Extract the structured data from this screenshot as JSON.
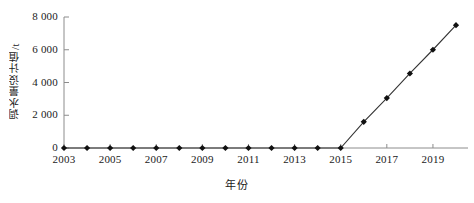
{
  "chart_data": {
    "type": "line",
    "title": "",
    "xlabel": "年份",
    "ylabel": "调水量设计值/t",
    "x": [
      2003,
      2004,
      2005,
      2006,
      2007,
      2008,
      2009,
      2010,
      2011,
      2012,
      2013,
      2014,
      2015,
      2016,
      2017,
      2018,
      2019,
      2020
    ],
    "values": [
      0,
      0,
      0,
      0,
      0,
      0,
      0,
      0,
      0,
      0,
      0,
      0,
      0,
      1600,
      3050,
      4550,
      6000,
      7500
    ],
    "series": [
      {
        "name": "调水量设计值",
        "values": [
          0,
          0,
          0,
          0,
          0,
          0,
          0,
          0,
          0,
          0,
          0,
          0,
          0,
          1600,
          3050,
          4550,
          6000,
          7500
        ]
      }
    ],
    "xlim": [
      2003,
      2020
    ],
    "ylim": [
      0,
      8000
    ],
    "yticks": [
      0,
      2000,
      4000,
      6000,
      8000
    ],
    "ytick_labels": [
      "0",
      "2 000",
      "4 000",
      "6 000",
      "8 000"
    ],
    "xticks": [
      2003,
      2005,
      2007,
      2009,
      2011,
      2013,
      2015,
      2017,
      2019
    ],
    "xtick_labels": [
      "2003",
      "2005",
      "2007",
      "2009",
      "2011",
      "2013",
      "2015",
      "2017",
      "2019"
    ],
    "grid": false,
    "legend": "none",
    "marker": "filled-diamond",
    "line_color": "#333333",
    "marker_color": "#111111",
    "axis_color": "#8c8c8c"
  }
}
